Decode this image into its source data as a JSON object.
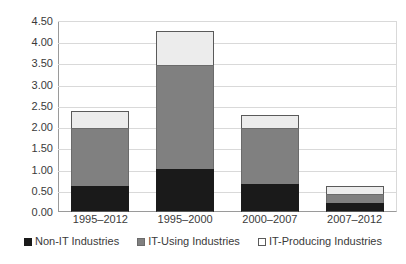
{
  "chart_data": {
    "type": "bar",
    "subtype": "stacked-vertical",
    "title": "",
    "subtitle": "",
    "xlabel": "",
    "ylabel": "",
    "categories": [
      "1995–2012",
      "1995–2000",
      "2000–2007",
      "2007–2012"
    ],
    "series": [
      {
        "name": "Non-IT Industries",
        "color": "#1a1a1a",
        "values": [
          0.62,
          1.02,
          0.67,
          0.21
        ]
      },
      {
        "name": "IT-Using Industries",
        "color": "#808080",
        "values": [
          1.35,
          2.45,
          1.3,
          0.22
        ]
      },
      {
        "name": "IT-Producing Industries",
        "color": "#ececec",
        "values": [
          0.4,
          0.8,
          0.31,
          0.19
        ]
      }
    ],
    "totals": [
      2.37,
      4.27,
      2.28,
      0.62
    ],
    "ylim": [
      0.0,
      4.5
    ],
    "ytick_step": 0.5,
    "ytick_labels": [
      "0.00",
      "0.50",
      "1.00",
      "1.50",
      "2.00",
      "2.50",
      "3.00",
      "3.50",
      "4.00",
      "4.50"
    ],
    "ytick_values": [
      0.0,
      0.5,
      1.0,
      1.5,
      2.0,
      2.5,
      3.0,
      3.5,
      4.0,
      4.5
    ],
    "grid": {
      "horizontal": true,
      "vertical": false,
      "color": "#d9d9d9"
    },
    "legend": {
      "position": "bottom",
      "entries": [
        {
          "label": "Non-IT Industries",
          "swatch": "solid-black"
        },
        {
          "label": "IT-Using Industries",
          "swatch": "solid-gray"
        },
        {
          "label": "IT-Producing Industries",
          "swatch": "outline-white"
        }
      ]
    },
    "colors": {
      "non_it": "#1a1a1a",
      "it_using": "#808080",
      "it_producing": "#ececec",
      "grid": "#d9d9d9",
      "axis": "#9a9a9a",
      "text": "#3a3a3a",
      "background": "#ffffff"
    }
  }
}
